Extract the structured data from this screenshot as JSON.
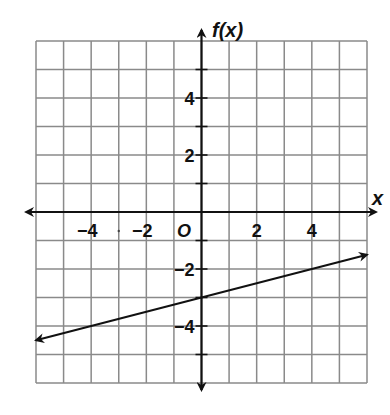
{
  "chart_data": {
    "type": "line",
    "title": "",
    "xlabel": "x",
    "ylabel": "f(x)",
    "origin_label": "O",
    "xlim": [
      -6,
      6
    ],
    "ylim": [
      -6,
      6
    ],
    "grid": true,
    "grid_step": 1,
    "x_ticks": [
      -4,
      -2,
      2,
      4
    ],
    "x_tick_labels": [
      "−4",
      "−2",
      "2",
      "4"
    ],
    "y_ticks": [
      4,
      2,
      -2,
      -4
    ],
    "y_tick_labels": [
      "4",
      "2",
      "−2",
      "−4"
    ],
    "series": [
      {
        "name": "f(x)",
        "equation": "f(x) = (1/4)x - 3",
        "slope": 0.25,
        "intercept": -3,
        "x": [
          -6,
          0,
          4,
          6
        ],
        "y": [
          -4.5,
          -3,
          -2,
          -1.5
        ],
        "arrows_both_ends": true
      }
    ]
  },
  "colors": {
    "grid": "#8a8a8a",
    "axis": "#111111",
    "line": "#111111",
    "background": "#ffffff"
  }
}
